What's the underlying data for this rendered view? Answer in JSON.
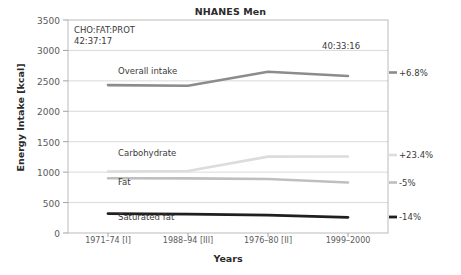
{
  "chart_data": {
    "type": "line",
    "title": "NHANES Men",
    "xlabel": "Years",
    "ylabel": "Energy Intake [kcal]",
    "categories": [
      "1971–74 [I]",
      "1988–94 [III]",
      "1976–80 [II]",
      "1999–2000"
    ],
    "ylim": [
      0,
      3500
    ],
    "ytick_labels": [
      "3500",
      "3000",
      "2500",
      "2000",
      "1500",
      "1000",
      "500",
      "0"
    ],
    "ytick_values": [
      3500,
      3000,
      2500,
      2000,
      1500,
      1000,
      500,
      0
    ],
    "grid": true,
    "legend": "inline-labels",
    "series": [
      {
        "name": "Overall intake",
        "label": "Overall intake",
        "color": "#8c8c8c",
        "values": [
          2430,
          2420,
          2650,
          2580
        ],
        "change_label": "+6.8%"
      },
      {
        "name": "Carbohydrate",
        "label": "Carbohydrate",
        "color": "#dcdcdc",
        "values": [
          1010,
          1020,
          1255,
          1258
        ],
        "change_label": "+23.4%"
      },
      {
        "name": "Fat",
        "label": "Fat",
        "color": "#bfbfbf",
        "values": [
          900,
          898,
          888,
          830
        ],
        "change_label": "-5%"
      },
      {
        "name": "Saturated fat",
        "label": "Saturated fat",
        "color": "#1f1f1f",
        "values": [
          320,
          310,
          295,
          258
        ],
        "change_label": "-14%"
      }
    ],
    "annotations": [
      {
        "name": "ratio-header",
        "text": "CHO:FAT:PROT"
      },
      {
        "name": "ratio-first",
        "text": "42:37:17"
      },
      {
        "name": "ratio-last",
        "text": "40:33:16"
      }
    ]
  }
}
